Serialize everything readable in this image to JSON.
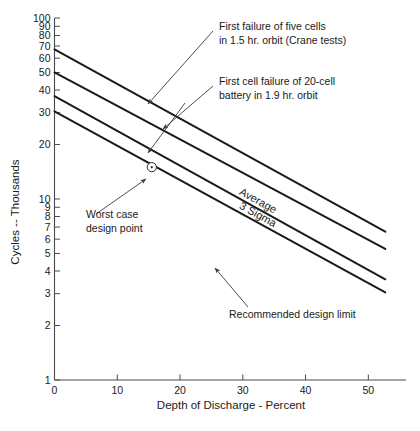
{
  "chart_data": {
    "type": "line",
    "title": "",
    "xlabel": "Depth of Discharge - Percent",
    "ylabel": "Cycles -- Thousands",
    "xlim": [
      0,
      56
    ],
    "ylim": [
      1,
      100
    ],
    "yscale": "log",
    "xscale": "linear",
    "grid": false,
    "legend_position": "inline-on-lines",
    "xticks": [
      0,
      10,
      20,
      30,
      40,
      50
    ],
    "xtick_labels": [
      "0",
      "10",
      "20",
      "30",
      "40",
      "50"
    ],
    "yticks": [
      1,
      2,
      3,
      4,
      5,
      6,
      7,
      8,
      9,
      10,
      20,
      30,
      40,
      50,
      60,
      70,
      80,
      90,
      100
    ],
    "ytick_labels": [
      "1",
      "2",
      "3",
      "4",
      "5",
      "6",
      "7",
      "8",
      "9",
      "10",
      "20",
      "30",
      "40",
      "50",
      "60",
      "70",
      "80",
      "90",
      "100"
    ],
    "series": [
      {
        "name": "First failure of five cells in 1.5 hr. orbit (Crane tests)",
        "x": [
          0,
          52.7
        ],
        "values": [
          67,
          6.6
        ],
        "inline_label": ""
      },
      {
        "name": "First cell failure of 20-cell battery in 1.9 hr. orbit",
        "x": [
          0,
          52.7
        ],
        "values": [
          50,
          5.3
        ],
        "inline_label": ""
      },
      {
        "name": "Average",
        "x": [
          0,
          52.7
        ],
        "values": [
          37,
          3.6
        ],
        "inline_label": "Average"
      },
      {
        "name": "3 Sigma",
        "x": [
          0,
          52.7
        ],
        "values": [
          30.5,
          3.05
        ],
        "inline_label": "3 Sigma"
      }
    ],
    "annotations": [
      {
        "name": "first-failure-five-cells",
        "lines": [
          "First failure of five cells",
          "in 1.5 hr. orbit (Crane tests)"
        ],
        "points_to_series": 0
      },
      {
        "name": "first-cell-failure-20-cell",
        "lines": [
          "First cell failure of 20-cell",
          "battery in 1.9 hr. orbit"
        ],
        "points_to_series": 1
      },
      {
        "name": "worst-case-design-point",
        "lines": [
          "Worst case",
          "design point"
        ],
        "marker_x": 15.5,
        "marker_y": 15.0
      },
      {
        "name": "recommended-design-limit",
        "lines": [
          "Recommended design limit"
        ],
        "points_to_series": 3
      }
    ],
    "colors": {
      "line": "#1a1a1a",
      "axis": "#4a4a4a",
      "text": "#1a1a1a",
      "background": "#ffffff"
    }
  }
}
